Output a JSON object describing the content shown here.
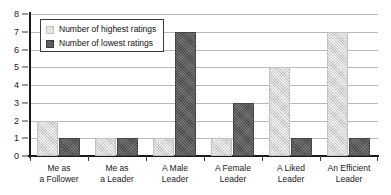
{
  "chart_data": {
    "type": "bar",
    "title": "",
    "subtitle": "",
    "xlabel": "",
    "ylabel": "",
    "ylim": [
      0,
      8
    ],
    "ytick_labels": [
      "0",
      "1",
      "2",
      "3",
      "4",
      "5",
      "6",
      "7",
      "8"
    ],
    "ytick_values": [
      0,
      1,
      2,
      3,
      4,
      5,
      6,
      7,
      8
    ],
    "grid": true,
    "grid_axis": "y",
    "legend_position": "upper-left",
    "categories": [
      "Me as a Follower",
      "Me as a Leader",
      "A Male Leader",
      "A Female Leader",
      "A Liked Leader",
      "An Efficient Leader"
    ],
    "category_lines": [
      [
        "Me as",
        "a Follower"
      ],
      [
        "Me as",
        "a Leader"
      ],
      [
        "A Male",
        "Leader"
      ],
      [
        "A Female",
        "Leader"
      ],
      [
        "A Liked",
        "Leader"
      ],
      [
        "An Efficient",
        "Leader"
      ]
    ],
    "series": [
      {
        "name": "Number of highest ratings",
        "color": "#d6d6d6",
        "values": [
          2,
          1,
          1,
          1,
          5,
          7
        ]
      },
      {
        "name": "Number of lowest ratings",
        "color": "#5b5b5b",
        "values": [
          1,
          1,
          7,
          3,
          1,
          1
        ]
      }
    ]
  },
  "legend": {
    "items": [
      {
        "label": "Number of highest ratings"
      },
      {
        "label": "Number of lowest ratings"
      }
    ]
  },
  "colors": {
    "highest": "#d6d6d6",
    "lowest": "#5b5b5b",
    "axis": "#1a1a1a",
    "grid": "#b9b9b9",
    "background": "#ffffff"
  }
}
